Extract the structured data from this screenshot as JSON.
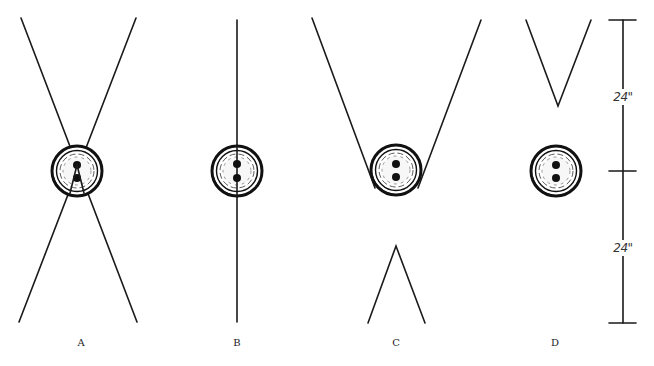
{
  "figure": {
    "panels": [
      {
        "id": "A",
        "label": "A",
        "description": "Two crossing lines forming an X through the button center"
      },
      {
        "id": "B",
        "label": "B",
        "description": "Single vertical line through the button center"
      },
      {
        "id": "C",
        "label": "C",
        "description": "V-shaped lines cradling the button from above, inverted V below"
      },
      {
        "id": "D",
        "label": "D",
        "description": "V shape above a free-standing button"
      }
    ],
    "dimension": {
      "upper_label": "24\"",
      "lower_label": "24\""
    },
    "colors": {
      "line": "#1a1a1a",
      "background": "#ffffff"
    }
  }
}
